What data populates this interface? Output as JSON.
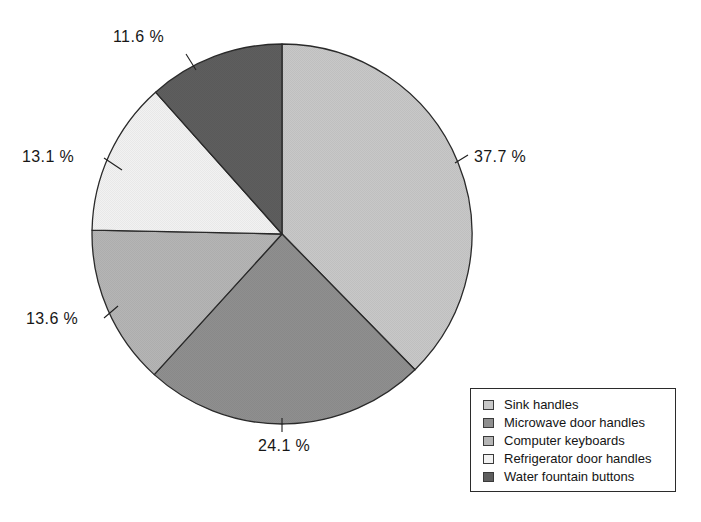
{
  "chart_data": {
    "type": "pie",
    "title": "",
    "subtitle": "",
    "xlabel": "",
    "ylabel": "",
    "grid": false,
    "legend_position": "bottom-right",
    "start_angle_deg": 0,
    "direction": "clockwise",
    "categories": [
      "Sink handles",
      "Microwave door handles",
      "Computer keyboards",
      "Refrigerator door handles",
      "Water fountain buttons"
    ],
    "values": [
      37.7,
      24.1,
      13.6,
      13.1,
      11.6
    ],
    "value_unit": "%",
    "data_labels": [
      "37.7 %",
      "24.1 %",
      "13.6 %",
      "13.1 %",
      "11.6 %"
    ],
    "colors": [
      "#c8c8c8",
      "#8f8f8f",
      "#b5b5b5",
      "#f2f2f2",
      "#5e5e5e"
    ],
    "slice_outline_color": "#2a2a2a"
  },
  "pie": {
    "center_x": 282,
    "center_y": 234,
    "radius": 190,
    "slices": [
      {
        "label": "Sink handles",
        "percent_text": "37.7 %",
        "value": 37.7,
        "color": "#c8c8c8",
        "label_x": 474,
        "label_y": 148,
        "leader": {
          "x1": 455,
          "y1": 163,
          "x2": 468,
          "y2": 155
        }
      },
      {
        "label": "Microwave door handles",
        "percent_text": "24.1 %",
        "value": 24.1,
        "color": "#8f8f8f",
        "label_x": 258,
        "label_y": 437,
        "leader": {
          "x1": 282,
          "y1": 418,
          "x2": 282,
          "y2": 432
        }
      },
      {
        "label": "Computer keyboards",
        "percent_text": "13.6 %",
        "value": 13.6,
        "color": "#b5b5b5",
        "label_x": 26,
        "label_y": 310,
        "leader": {
          "x1": 118,
          "y1": 306,
          "x2": 104,
          "y2": 318
        }
      },
      {
        "label": "Refrigerator door handles",
        "percent_text": "13.1 %",
        "value": 13.1,
        "color": "#f2f2f2",
        "label_x": 22,
        "label_y": 148,
        "leader": {
          "x1": 122,
          "y1": 170,
          "x2": 104,
          "y2": 158
        }
      },
      {
        "label": "Water fountain buttons",
        "percent_text": "11.6 %",
        "value": 11.6,
        "color": "#5e5e5e",
        "label_x": 113,
        "label_y": 28,
        "leader": {
          "x1": 196,
          "y1": 70,
          "x2": 186,
          "y2": 54
        }
      }
    ]
  },
  "legend": {
    "items": [
      {
        "label": "Sink handles",
        "color": "#c8c8c8"
      },
      {
        "label": "Microwave door handles",
        "color": "#8f8f8f"
      },
      {
        "label": "Computer keyboards",
        "color": "#b5b5b5"
      },
      {
        "label": "Refrigerator door handles",
        "color": "#f2f2f2"
      },
      {
        "label": "Water fountain buttons",
        "color": "#5e5e5e"
      }
    ]
  }
}
